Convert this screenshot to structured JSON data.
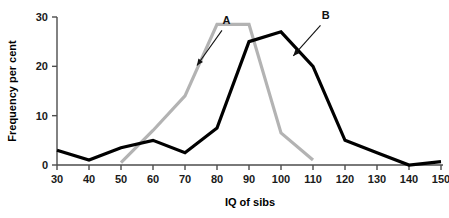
{
  "chart_data": {
    "type": "line",
    "title": "",
    "xlabel": "IQ of sibs",
    "ylabel": "Frequency per cent",
    "xlim": [
      30,
      150
    ],
    "ylim": [
      0,
      30
    ],
    "xticks": [
      30,
      40,
      50,
      60,
      70,
      80,
      90,
      100,
      110,
      120,
      130,
      140,
      150
    ],
    "yticks": [
      0,
      10,
      20,
      30
    ],
    "grid": false,
    "legend_position": "inline-annotation",
    "series": [
      {
        "name": "A",
        "color": "#b3b3b3",
        "x": [
          50,
          60,
          70,
          80,
          90,
          100,
          110
        ],
        "values": [
          0.5,
          7,
          14,
          28.5,
          28.5,
          6.5,
          1
        ]
      },
      {
        "name": "B",
        "color": "#000000",
        "x": [
          30,
          40,
          50,
          60,
          70,
          80,
          90,
          100,
          110,
          120,
          130,
          140,
          150
        ],
        "values": [
          3,
          1,
          3.5,
          5,
          2.5,
          7.5,
          25,
          27,
          20,
          5,
          2.5,
          0,
          0.7
        ]
      }
    ],
    "annotations": [
      {
        "text": "A",
        "x": 83,
        "y": 28.6,
        "points_to_x": 73,
        "points_to_y": 19.5
      },
      {
        "text": "B",
        "x": 114,
        "y": 29.5,
        "points_to_x": 103,
        "points_to_y": 21.5
      }
    ]
  },
  "axes": {
    "x_tick_labels": [
      "30",
      "40",
      "50",
      "60",
      "70",
      "80",
      "90",
      "100",
      "110",
      "120",
      "130",
      "140",
      "150"
    ],
    "y_tick_labels": [
      "0",
      "10",
      "20",
      "30"
    ],
    "x_axis_title": "IQ of sibs",
    "y_axis_title": "Frequency per cent"
  },
  "series_labels": {
    "a": "A",
    "b": "B"
  },
  "colors": {
    "series_a": "#b3b3b3",
    "series_b": "#000000",
    "axis": "#4d4d4d",
    "text": "#111111",
    "background": "#ffffff"
  }
}
